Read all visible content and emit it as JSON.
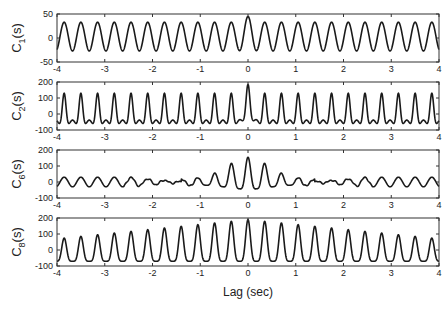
{
  "chart_data": [
    {
      "type": "line",
      "ylabel": "C1(s)",
      "ylabel_main": "C",
      "ylabel_sub": "1",
      "ylabel_suffix": "(s)",
      "xlim": [
        -4,
        4
      ],
      "ylim": [
        -50,
        50
      ],
      "yticks": [
        -50,
        0,
        50
      ],
      "xticks": [
        -4,
        -3,
        -2,
        -1,
        0,
        1,
        2,
        3,
        4
      ],
      "period_sec": 0.35,
      "description": "Regular sinusoidal autocorrelation, peaks ~+33, troughs ~-27, slightly higher peak (~45) at lag 0",
      "peak": 33,
      "trough": -27,
      "center_peak": 45,
      "envelope": "flat"
    },
    {
      "type": "line",
      "ylabel": "C2(s)",
      "ylabel_main": "C",
      "ylabel_sub": "2",
      "ylabel_suffix": "(s)",
      "xlim": [
        -4,
        4
      ],
      "ylim": [
        -100,
        200
      ],
      "yticks": [
        -100,
        0,
        100,
        200
      ],
      "xticks": [
        -4,
        -3,
        -2,
        -1,
        0,
        1,
        2,
        3,
        4
      ],
      "period_sec": 0.35,
      "description": "Sharp periodic peaks ~130 with double-dipped troughs ~-60, center peak ~185 at lag 0",
      "peak": 130,
      "trough": -60,
      "center_peak": 185,
      "envelope": "flat-sharp"
    },
    {
      "type": "line",
      "ylabel": "C6(s)",
      "ylabel_main": "C",
      "ylabel_sub": "6",
      "ylabel_suffix": "(s)",
      "xlim": [
        -4,
        4
      ],
      "ylim": [
        -100,
        200
      ],
      "yticks": [
        -100,
        0,
        100,
        200
      ],
      "xticks": [
        -4,
        -3,
        -2,
        -1,
        0,
        1,
        2,
        3,
        4
      ],
      "period_sec": 0.35,
      "description": "Small oscillation ±30 at edges, noisy near ±1.5 s, growing to center peak ~125 at lag 0",
      "peak": 30,
      "trough": -30,
      "center_peak": 125,
      "envelope": "center-burst"
    },
    {
      "type": "line",
      "ylabel": "C8(s)",
      "ylabel_main": "C",
      "ylabel_sub": "8",
      "ylabel_suffix": "(s)",
      "xlim": [
        -4,
        4
      ],
      "ylim": [
        -100,
        200
      ],
      "yticks": [
        -100,
        0,
        100,
        200
      ],
      "xticks": [
        -4,
        -3,
        -2,
        -1,
        0,
        1,
        2,
        3,
        4
      ],
      "period_sec": 0.35,
      "description": "Periodic peaks growing from ~70 at edges to ~190 at lag 0, troughs ~-70",
      "peak": 70,
      "trough": -70,
      "center_peak": 190,
      "envelope": "triangular"
    }
  ],
  "xlabel": "Lag (sec)"
}
